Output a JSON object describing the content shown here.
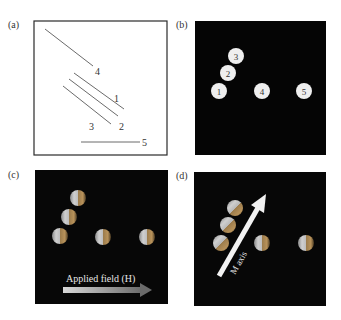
{
  "figure": {
    "panels": [
      {
        "label": "(a)",
        "type": "line-schematic",
        "background": "#ffffff",
        "lines": [
          {
            "id": "1",
            "label": "1"
          },
          {
            "id": "2",
            "label": "2"
          },
          {
            "id": "3",
            "label": "3"
          },
          {
            "id": "4",
            "label": "4"
          },
          {
            "id": "5",
            "label": "5"
          }
        ]
      },
      {
        "label": "(b)",
        "type": "numbered-particles",
        "background": "#050505",
        "particles": [
          {
            "label": "1"
          },
          {
            "label": "2"
          },
          {
            "label": "3"
          },
          {
            "label": "4"
          },
          {
            "label": "5"
          }
        ]
      },
      {
        "label": "(c)",
        "type": "magnetized-particles",
        "background": "#070707",
        "arrow_label": "Applied field (H)"
      },
      {
        "label": "(d)",
        "type": "magnetized-particles-rotated",
        "background": "#070707",
        "arrow_label": "M axis"
      }
    ],
    "colors": {
      "line": "#6b6b6b",
      "frame": "#2a2a2a",
      "particle_fill": "#efefef",
      "sphere_light": "#c9c9c9",
      "sphere_warm": "#b8925a",
      "arrow_light": "#d8d8d8",
      "arrow_dark": "#6a6a6a"
    }
  }
}
